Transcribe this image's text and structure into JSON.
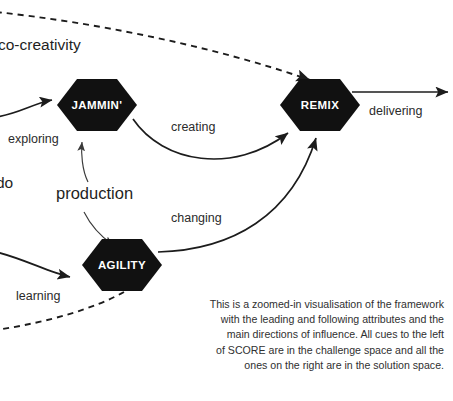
{
  "diagram": {
    "nodes": [
      {
        "id": "jammin",
        "label": "JAMMIN'",
        "cx": 97,
        "cy": 105
      },
      {
        "id": "remix",
        "label": "REMIX",
        "cx": 320,
        "cy": 105
      },
      {
        "id": "agility",
        "label": "AGILITY",
        "cx": 122,
        "cy": 265
      }
    ],
    "edge_labels": [
      {
        "id": "exploring",
        "text": "exploring",
        "x": 8,
        "y": 143
      },
      {
        "id": "learning",
        "text": "learning",
        "x": 16,
        "y": 300
      },
      {
        "id": "creating",
        "text": "creating",
        "x": 171,
        "y": 131
      },
      {
        "id": "changing",
        "text": "changing",
        "x": 171,
        "y": 222
      },
      {
        "id": "delivering",
        "text": "delivering",
        "x": 369,
        "y": 115
      }
    ],
    "space_labels": [
      {
        "id": "co-creativity",
        "text": "co-creativity",
        "x": 0,
        "y": 50
      },
      {
        "id": "do",
        "text": "do",
        "x": 0,
        "y": 188
      }
    ],
    "emphasis_labels": [
      {
        "id": "production",
        "text": "production",
        "x": 56,
        "y": 199
      }
    ],
    "colors": {
      "node_fill": "#111111",
      "node_text": "#ffffff",
      "edge_stroke": "#1c1c1c",
      "thin_stroke": "#3a3a3a",
      "background": "#ffffff",
      "label_text": "#2b2b2b",
      "caption_text": "#303030"
    }
  },
  "caption": {
    "lines": [
      "This is a zoomed-in visualisation of the framework",
      "with the leading and following attributes and the",
      "main directions of influence. All cues to the left",
      "of SCORE are in the challenge space and all the",
      "ones on the right are in the solution space."
    ]
  }
}
